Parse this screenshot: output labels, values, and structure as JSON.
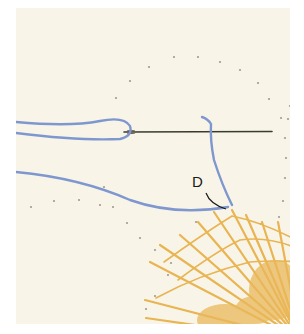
{
  "figure": {
    "label": "D",
    "colors": {
      "background": "#f8f5e8",
      "thread": "#7f97cf",
      "lace": "#e9b452",
      "needle": "#3a3a2e",
      "dots": "#a39c8e"
    }
  }
}
